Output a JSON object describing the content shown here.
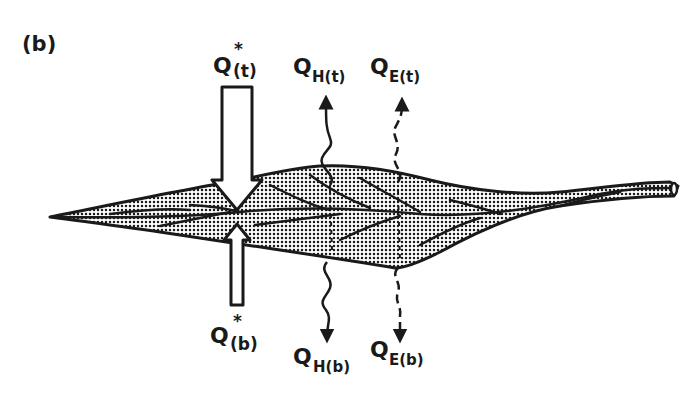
{
  "panel_label": "(b)",
  "labels": {
    "q_star_top": {
      "main": "Q",
      "sup": "*",
      "sub": "(t)"
    },
    "qh_top": {
      "main": "Q",
      "sub": "H(t)"
    },
    "qe_top": {
      "main": "Q",
      "sub": "E(t)"
    },
    "q_star_bottom": {
      "main": "Q",
      "sup": "*",
      "sub": "(b)"
    },
    "qh_bottom": {
      "main": "Q",
      "sub": "H(b)"
    },
    "qe_bottom": {
      "main": "Q",
      "sub": "E(b)"
    }
  },
  "colors": {
    "ink": "#1a1a1a",
    "leaf_fill": "#bdbdbd",
    "background": "#ffffff"
  }
}
